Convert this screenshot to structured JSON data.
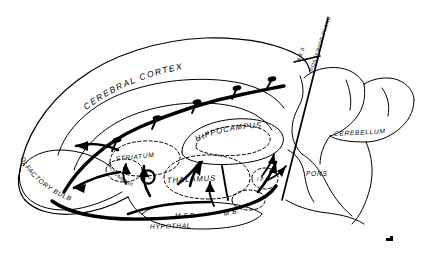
{
  "figure": {
    "kind": "anatomical-diagram",
    "background_color": "#ffffff",
    "ink_color": "#000000"
  },
  "labels": {
    "cerebral_cortex": "CEREBRAL CORTEX",
    "hippocampus": "HIPPOCAMPUS",
    "striatum": "STRIATUM",
    "thalamus": "THALAMUS",
    "accumbens": "ACCUMBENS",
    "olfactory_bulb": "OLFACTORY BULB",
    "hypothalamus": "HYPOTHAL",
    "mfb": "M.F.B.",
    "mb": "M.B.",
    "ip": "I.P.",
    "ac": "A.C.",
    "cerebellum": "CEREBELLUM",
    "pons": "PONS",
    "posterior_plane": "POSTERIOR PLANE",
    "plane_coordinate": "A 1.6"
  },
  "structures": [
    {
      "name": "cerebral-cortex",
      "label": "CEREBRAL CORTEX",
      "style": "solid-outline"
    },
    {
      "name": "hippocampus",
      "label": "HIPPOCAMPUS",
      "style": "dashed-outline"
    },
    {
      "name": "striatum",
      "label": "STRIATUM",
      "style": "dashed-outline"
    },
    {
      "name": "thalamus",
      "label": "THALAMUS",
      "style": "dashed-outline"
    },
    {
      "name": "nucleus-accumbens",
      "label": "ACCUMBENS",
      "style": "dashed-outline"
    },
    {
      "name": "olfactory-bulb",
      "label": "OLFACTORY BULB",
      "style": "solid-outline"
    },
    {
      "name": "hypothalamus",
      "label": "HYPOTHAL",
      "style": "solid-outline"
    },
    {
      "name": "medial-forebrain-bundle",
      "label": "M.F.B.",
      "style": "fiber-tract"
    },
    {
      "name": "mammillary-body",
      "label": "M.B.",
      "style": "dashed-outline"
    },
    {
      "name": "interpeduncular-nucleus",
      "label": "I.P.",
      "style": "dashed-outline"
    },
    {
      "name": "anterior-commissure",
      "label": "A.C.",
      "style": "solid-circle"
    },
    {
      "name": "cerebellum",
      "label": "CEREBELLUM",
      "style": "solid-outline"
    },
    {
      "name": "pons",
      "label": "PONS",
      "style": "solid-outline"
    }
  ],
  "annotations": {
    "section_plane": {
      "label": "POSTERIOR PLANE",
      "coordinate": "A 1.6"
    }
  }
}
